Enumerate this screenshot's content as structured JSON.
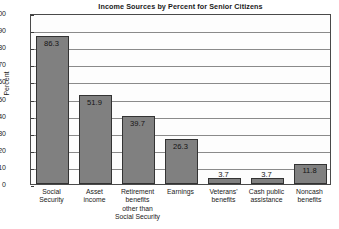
{
  "chart_data": {
    "type": "bar",
    "title": "Income Sources by Percent for Senior Citizens",
    "xlabel": "",
    "ylabel": "Percent",
    "ylim": [
      0,
      100
    ],
    "ytick_step": 10,
    "yticks": [
      "100",
      "90",
      "80",
      "70",
      "60",
      "50",
      "40",
      "30",
      "20",
      "10",
      "0"
    ],
    "grid": "horizontal",
    "legend": "none",
    "bar_color": "#808080",
    "bar_edge_color": "#333333",
    "plot_background": "#fdfdfd",
    "categories": [
      "Social Security",
      "Asset income",
      "Retirement benefits other than Social Security",
      "Earnings",
      "Veterans' benefits",
      "Cash public assistance",
      "Noncash benefits"
    ],
    "category_label_lines": [
      [
        "Social",
        "Security"
      ],
      [
        "Asset",
        "income"
      ],
      [
        "Retirement",
        "benefits",
        "other than",
        "Social Security"
      ],
      [
        "Earnings"
      ],
      [
        "Veterans'",
        "benefits"
      ],
      [
        "Cash public",
        "assistance"
      ],
      [
        "Noncash",
        "benefits"
      ]
    ],
    "values": [
      86.3,
      51.9,
      39.7,
      26.3,
      3.7,
      3.7,
      11.8
    ],
    "value_labels": [
      "86.3",
      "51.9",
      "39.7",
      "26.3",
      "3.7",
      "3.7",
      "11.8"
    ],
    "value_label_position": [
      "inside",
      "inside",
      "inside",
      "inside",
      "above",
      "above",
      "inside"
    ]
  }
}
